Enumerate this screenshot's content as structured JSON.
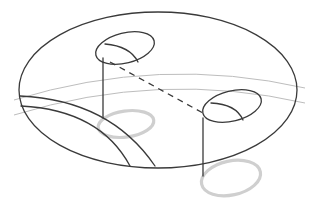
{
  "diagram": {
    "title": "",
    "colors": {
      "background": "#ffffff",
      "ink": "#3a3a3a",
      "faint_guide": "#bdbdbd",
      "shadow": "#cfcfcf"
    },
    "elements": {
      "outer_disc": {
        "cx": 158,
        "cy": 90,
        "rx": 139,
        "ry": 78
      },
      "handle_upper": {
        "cx": 125,
        "cy": 48,
        "rx": 30,
        "ry": 15
      },
      "handle_lower": {
        "cx": 232,
        "cy": 106,
        "rx": 30,
        "ry": 15
      },
      "shadow_upper": {
        "cx": 126,
        "cy": 124,
        "rx": 28,
        "ry": 13
      },
      "shadow_lower": {
        "cx": 231,
        "cy": 178,
        "rx": 30,
        "ry": 17
      },
      "stem_upper": {
        "x": 103,
        "y1": 58,
        "y2": 118
      },
      "stem_lower": {
        "x": 203,
        "y1": 118,
        "y2": 176
      },
      "connector_dashed": {
        "x1": 110,
        "y1": 60,
        "x2": 205,
        "y2": 113
      }
    },
    "labels": []
  }
}
